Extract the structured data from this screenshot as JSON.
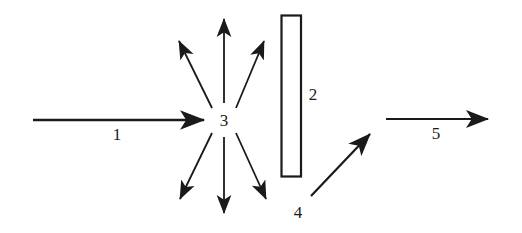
{
  "figure": {
    "type": "schematic-diagram",
    "background_color": "#ffffff",
    "stroke_color": "#1a1a1a",
    "label_color": "#1a1a1a"
  },
  "labels": [
    {
      "id": "label-1",
      "text": "1",
      "x": 117,
      "y": 134,
      "describes": "incoming horizontal beam arrow"
    },
    {
      "id": "label-2",
      "text": "2",
      "x": 313,
      "y": 94,
      "describes": "vertical rectangular slab"
    },
    {
      "id": "label-3",
      "text": "3",
      "x": 224,
      "y": 120,
      "describes": "central scattering node"
    },
    {
      "id": "label-4",
      "text": "4",
      "x": 298,
      "y": 212,
      "describes": "diagonal upward arrow"
    },
    {
      "id": "label-5",
      "text": "5",
      "x": 436,
      "y": 133,
      "describes": "outgoing horizontal beam arrow"
    }
  ],
  "shapes": {
    "incoming_arrow": {
      "name": "incoming-beam-arrow",
      "x1": 33,
      "y1": 120,
      "x2": 204,
      "y2": 120
    },
    "scatter_center": {
      "name": "scattering-center",
      "cx": 224,
      "cy": 120,
      "inner_radius": 17
    },
    "scatter_arrows": [
      {
        "name": "scatter-arrow-up",
        "x1": 224,
        "y1": 103,
        "x2": 224,
        "y2": 17
      },
      {
        "name": "scatter-arrow-up-left",
        "x1": 212,
        "y1": 108,
        "x2": 177,
        "y2": 38
      },
      {
        "name": "scatter-arrow-up-right",
        "x1": 236,
        "y1": 108,
        "x2": 266,
        "y2": 38
      },
      {
        "name": "scatter-arrow-down",
        "x1": 224,
        "y1": 137,
        "x2": 224,
        "y2": 216
      },
      {
        "name": "scatter-arrow-down-left",
        "x1": 212,
        "y1": 133,
        "x2": 178,
        "y2": 202
      },
      {
        "name": "scatter-arrow-down-right",
        "x1": 236,
        "y1": 133,
        "x2": 268,
        "y2": 202
      }
    ],
    "slab": {
      "name": "vertical-slab",
      "x": 281,
      "y": 15,
      "width": 20,
      "height": 162,
      "fill": "#ffffff",
      "stroke": "#1a1a1a"
    },
    "diagonal_arrow": {
      "name": "diagonal-output-arrow",
      "x1": 311,
      "y1": 196,
      "x2": 373,
      "y2": 131
    },
    "outgoing_arrow": {
      "name": "outgoing-beam-arrow",
      "x1": 386,
      "y1": 119,
      "x2": 491,
      "y2": 119
    }
  }
}
